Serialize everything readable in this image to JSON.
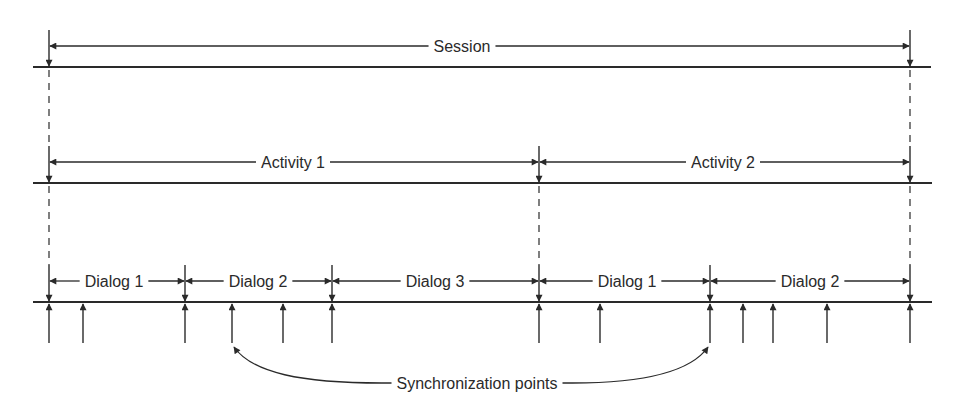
{
  "diagram": {
    "type": "timeline-hierarchy",
    "colors": {
      "ink": "#2a2a2a",
      "background": "#ffffff"
    },
    "levels": [
      {
        "name": "Session",
        "line_y": 67,
        "line_x": [
          33,
          931
        ],
        "segments": [
          {
            "label": "Session",
            "start_x": 49,
            "end_x": 910,
            "label_x": 462
          }
        ]
      },
      {
        "name": "Activity",
        "line_y": 183,
        "line_x": [
          33,
          932
        ],
        "segments": [
          {
            "label": "Activity 1",
            "start_x": 49,
            "end_x": 539,
            "label_x": 293
          },
          {
            "label": "Activity 2",
            "start_x": 539,
            "end_x": 910,
            "label_x": 723
          }
        ]
      },
      {
        "name": "Dialog",
        "line_y": 302,
        "line_x": [
          33,
          932
        ],
        "segments": [
          {
            "label": "Dialog 1",
            "start_x": 49,
            "end_x": 185,
            "label_x": 114
          },
          {
            "label": "Dialog 2",
            "start_x": 185,
            "end_x": 332,
            "label_x": 258
          },
          {
            "label": "Dialog 3",
            "start_x": 332,
            "end_x": 539,
            "label_x": 435
          },
          {
            "label": "Dialog 1",
            "start_x": 539,
            "end_x": 710,
            "label_x": 627
          },
          {
            "label": "Dialog 2",
            "start_x": 710,
            "end_x": 910,
            "label_x": 810
          }
        ]
      }
    ],
    "sync_points_x": [
      49,
      83,
      185,
      232,
      283,
      332,
      539,
      600,
      710,
      743,
      773,
      827,
      910
    ],
    "annotation": {
      "label": "Synchronization points",
      "label_x": 477,
      "label_y": 389,
      "targets_x": [
        232,
        710
      ]
    }
  }
}
